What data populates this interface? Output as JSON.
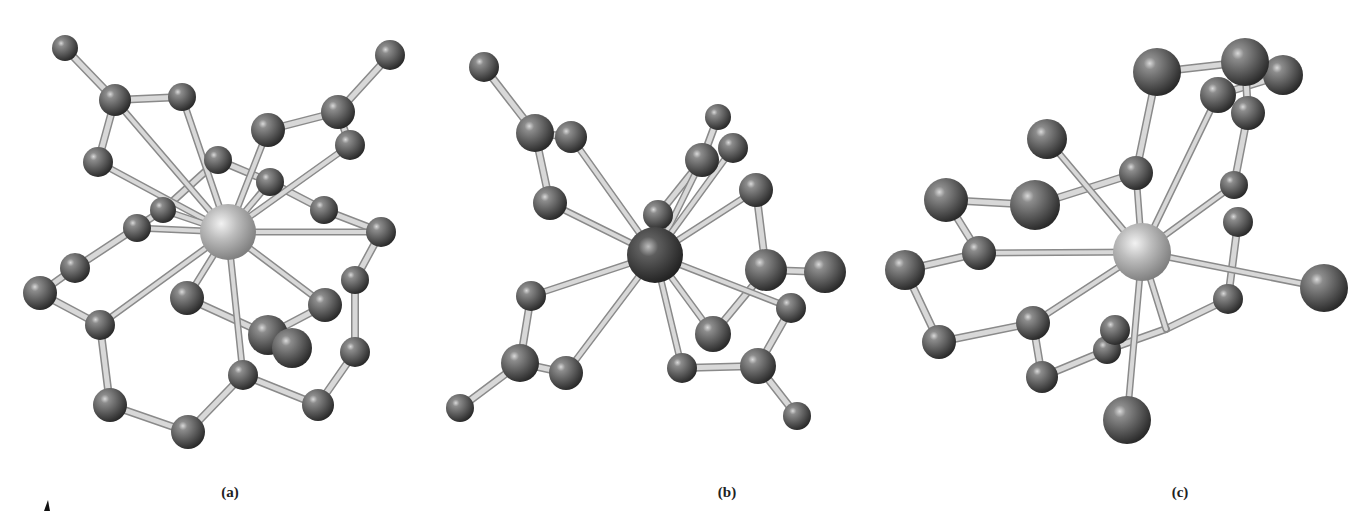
{
  "figure": {
    "panels": [
      {
        "label": "(a)",
        "label_pos": [
          230,
          493
        ],
        "center": {
          "x": 228,
          "y": 232,
          "r": 28,
          "shade": "light"
        },
        "atoms": [
          [
            65,
            48,
            13
          ],
          [
            115,
            100,
            16
          ],
          [
            182,
            97,
            14
          ],
          [
            98,
            162,
            15
          ],
          [
            268,
            130,
            17
          ],
          [
            338,
            112,
            17
          ],
          [
            390,
            55,
            15
          ],
          [
            350,
            145,
            15
          ],
          [
            218,
            160,
            14
          ],
          [
            270,
            182,
            14
          ],
          [
            324,
            210,
            14
          ],
          [
            381,
            232,
            15
          ],
          [
            163,
            210,
            13
          ],
          [
            137,
            228,
            14
          ],
          [
            75,
            268,
            15
          ],
          [
            40,
            293,
            17
          ],
          [
            100,
            325,
            15
          ],
          [
            355,
            280,
            14
          ],
          [
            187,
            298,
            17
          ],
          [
            325,
            305,
            17
          ],
          [
            268,
            335,
            20
          ],
          [
            292,
            348,
            20
          ],
          [
            355,
            352,
            15
          ],
          [
            243,
            375,
            15
          ],
          [
            110,
            405,
            17
          ],
          [
            188,
            432,
            17
          ],
          [
            318,
            405,
            16
          ]
        ],
        "metal_bonds": [
          [
            115,
            100
          ],
          [
            182,
            97
          ],
          [
            98,
            162
          ],
          [
            268,
            130
          ],
          [
            350,
            145
          ],
          [
            163,
            210
          ],
          [
            137,
            228
          ],
          [
            100,
            325
          ],
          [
            187,
            298
          ],
          [
            325,
            305
          ],
          [
            381,
            232
          ],
          [
            243,
            375
          ],
          [
            270,
            182
          ]
        ],
        "ring_bonds": [
          [
            [
              65,
              48
            ],
            [
              115,
              100
            ]
          ],
          [
            [
              115,
              100
            ],
            [
              182,
              97
            ]
          ],
          [
            [
              115,
              100
            ],
            [
              98,
              162
            ]
          ],
          [
            [
              268,
              130
            ],
            [
              338,
              112
            ]
          ],
          [
            [
              338,
              112
            ],
            [
              390,
              55
            ]
          ],
          [
            [
              338,
              112
            ],
            [
              350,
              145
            ]
          ],
          [
            [
              218,
              160
            ],
            [
              270,
              182
            ]
          ],
          [
            [
              270,
              182
            ],
            [
              324,
              210
            ]
          ],
          [
            [
              324,
              210
            ],
            [
              381,
              232
            ]
          ],
          [
            [
              381,
              232
            ],
            [
              355,
              280
            ]
          ],
          [
            [
              355,
              280
            ],
            [
              355,
              352
            ]
          ],
          [
            [
              355,
              352
            ],
            [
              318,
              405
            ]
          ],
          [
            [
              318,
              405
            ],
            [
              243,
              375
            ]
          ],
          [
            [
              243,
              375
            ],
            [
              188,
              432
            ]
          ],
          [
            [
              188,
              432
            ],
            [
              110,
              405
            ]
          ],
          [
            [
              110,
              405
            ],
            [
              100,
              325
            ]
          ],
          [
            [
              100,
              325
            ],
            [
              40,
              293
            ]
          ],
          [
            [
              40,
              293
            ],
            [
              75,
              268
            ]
          ],
          [
            [
              75,
              268
            ],
            [
              163,
              210
            ]
          ],
          [
            [
              187,
              298
            ],
            [
              268,
              335
            ]
          ],
          [
            [
              268,
              335
            ],
            [
              325,
              305
            ]
          ],
          [
            [
              268,
              335
            ],
            [
              292,
              348
            ]
          ],
          [
            [
              218,
              160
            ],
            [
              163,
              210
            ]
          ]
        ]
      },
      {
        "label": "(b)",
        "label_pos": [
          727,
          493
        ],
        "center": {
          "x": 655,
          "y": 255,
          "r": 28,
          "shade": "dark"
        },
        "atoms": [
          [
            484,
            67,
            15
          ],
          [
            535,
            133,
            19
          ],
          [
            571,
            137,
            16
          ],
          [
            550,
            203,
            17
          ],
          [
            718,
            117,
            13
          ],
          [
            702,
            160,
            17
          ],
          [
            733,
            148,
            15
          ],
          [
            658,
            215,
            15
          ],
          [
            756,
            190,
            17
          ],
          [
            766,
            270,
            21
          ],
          [
            825,
            272,
            21
          ],
          [
            531,
            296,
            15
          ],
          [
            791,
            308,
            15
          ],
          [
            713,
            334,
            18
          ],
          [
            520,
            363,
            19
          ],
          [
            566,
            373,
            17
          ],
          [
            682,
            368,
            15
          ],
          [
            758,
            366,
            18
          ],
          [
            460,
            408,
            14
          ],
          [
            797,
            416,
            14
          ]
        ],
        "metal_bonds": [
          [
            571,
            137
          ],
          [
            550,
            203
          ],
          [
            702,
            160
          ],
          [
            733,
            148
          ],
          [
            658,
            215
          ],
          [
            756,
            190
          ],
          [
            791,
            308
          ],
          [
            713,
            334
          ],
          [
            682,
            368
          ],
          [
            531,
            296
          ],
          [
            566,
            373
          ]
        ],
        "ring_bonds": [
          [
            [
              484,
              67
            ],
            [
              535,
              133
            ]
          ],
          [
            [
              535,
              133
            ],
            [
              571,
              137
            ]
          ],
          [
            [
              535,
              133
            ],
            [
              550,
              203
            ]
          ],
          [
            [
              718,
              117
            ],
            [
              702,
              160
            ]
          ],
          [
            [
              756,
              190
            ],
            [
              766,
              270
            ]
          ],
          [
            [
              766,
              270
            ],
            [
              825,
              272
            ]
          ],
          [
            [
              766,
              270
            ],
            [
              713,
              334
            ]
          ],
          [
            [
              791,
              308
            ],
            [
              758,
              366
            ]
          ],
          [
            [
              758,
              366
            ],
            [
              682,
              368
            ]
          ],
          [
            [
              758,
              366
            ],
            [
              797,
              416
            ]
          ],
          [
            [
              531,
              296
            ],
            [
              520,
              363
            ]
          ],
          [
            [
              520,
              363
            ],
            [
              566,
              373
            ]
          ],
          [
            [
              520,
              363
            ],
            [
              460,
              408
            ]
          ],
          [
            [
              658,
              215
            ],
            [
              702,
              160
            ]
          ]
        ]
      },
      {
        "label": "(c)",
        "label_pos": [
          1180,
          493
        ],
        "center": {
          "x": 1142,
          "y": 252,
          "r": 29,
          "shade": "light"
        },
        "atoms": [
          [
            1157,
            72,
            24
          ],
          [
            1245,
            62,
            24
          ],
          [
            1283,
            75,
            20
          ],
          [
            1218,
            95,
            18
          ],
          [
            1248,
            113,
            17
          ],
          [
            1047,
            139,
            20
          ],
          [
            1136,
            173,
            17
          ],
          [
            1234,
            185,
            14
          ],
          [
            1238,
            222,
            15
          ],
          [
            946,
            200,
            22
          ],
          [
            1035,
            205,
            25
          ],
          [
            979,
            253,
            17
          ],
          [
            905,
            270,
            20
          ],
          [
            1033,
            323,
            17
          ],
          [
            939,
            342,
            17
          ],
          [
            1115,
            330,
            15
          ],
          [
            1107,
            350,
            14
          ],
          [
            1042,
            377,
            16
          ],
          [
            1228,
            299,
            15
          ],
          [
            1324,
            288,
            24
          ],
          [
            1127,
            420,
            24
          ]
        ],
        "metal_bonds": [
          [
            1047,
            139
          ],
          [
            1136,
            173
          ],
          [
            1218,
            95
          ],
          [
            1234,
            185
          ],
          [
            979,
            253
          ],
          [
            1033,
            323
          ],
          [
            1324,
            288
          ],
          [
            1127,
            420
          ],
          [
            1166,
            329
          ]
        ],
        "ring_bonds": [
          [
            [
              1157,
              72
            ],
            [
              1245,
              62
            ]
          ],
          [
            [
              1218,
              95
            ],
            [
              1283,
              75
            ]
          ],
          [
            [
              1245,
              62
            ],
            [
              1248,
              113
            ]
          ],
          [
            [
              1157,
              72
            ],
            [
              1136,
              173
            ]
          ],
          [
            [
              1248,
              113
            ],
            [
              1234,
              185
            ]
          ],
          [
            [
              1238,
              222
            ],
            [
              1228,
              299
            ]
          ],
          [
            [
              1228,
              299
            ],
            [
              1166,
              329
            ]
          ],
          [
            [
              1166,
              329
            ],
            [
              1107,
              350
            ]
          ],
          [
            [
              1107,
              350
            ],
            [
              1042,
              377
            ]
          ],
          [
            [
              1042,
              377
            ],
            [
              1033,
              323
            ]
          ],
          [
            [
              1033,
              323
            ],
            [
              939,
              342
            ]
          ],
          [
            [
              939,
              342
            ],
            [
              905,
              270
            ]
          ],
          [
            [
              905,
              270
            ],
            [
              979,
              253
            ]
          ],
          [
            [
              979,
              253
            ],
            [
              946,
              200
            ]
          ],
          [
            [
              946,
              200
            ],
            [
              1035,
              205
            ]
          ],
          [
            [
              1035,
              205
            ],
            [
              1136,
              173
            ]
          ]
        ]
      }
    ]
  },
  "colors": {
    "background": "#ffffff",
    "atom": "#5a5a5a",
    "atom_dark": "#333333",
    "metal_light": "#b8b8b8",
    "metal_dark": "#3c3c3c",
    "bond": "#d8d8d8",
    "bond_edge": "#8a8a8a",
    "label": "#222222"
  }
}
